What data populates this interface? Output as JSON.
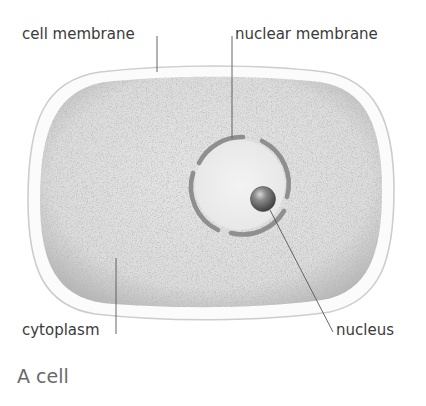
{
  "figure": {
    "caption": "A cell",
    "labels": {
      "cell_membrane": "cell membrane",
      "nuclear_membrane": "nuclear membrane",
      "cytoplasm": "cytoplasm",
      "nucleus": "nucleus"
    },
    "colors": {
      "background": "#ffffff",
      "membrane_fill": "#fafafa",
      "membrane_stroke": "#cfcfcf",
      "cytoplasm_fill": "#d9d9d9",
      "cytoplasm_edge": "#b5b5b5",
      "nuclear_interior": "#eeeeee",
      "nuclear_membrane": "#8e8e8e",
      "nucleus": "#6d6d6d",
      "leader_line": "#555555",
      "label_text": "#3b3b3b",
      "caption_text": "#6a6a6a"
    }
  }
}
